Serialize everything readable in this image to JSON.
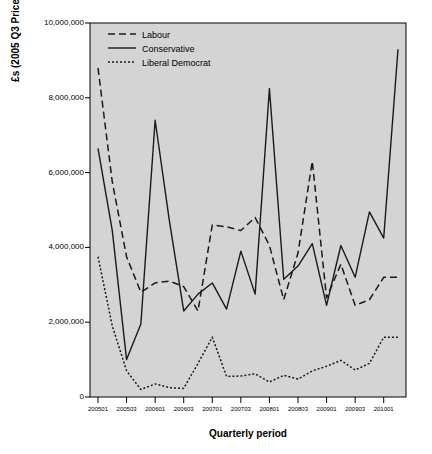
{
  "chart_data": {
    "type": "line",
    "title": "",
    "xlabel": "Quarterly period",
    "ylabel": "£s (2005 Q3 Prices)",
    "grid": false,
    "legend_position": "top-left",
    "ylim": [
      0,
      10000000
    ],
    "ytick_values": [
      0,
      2000000,
      4000000,
      6000000,
      8000000,
      10000000
    ],
    "ytick_labels": [
      "0",
      "2,000,000",
      "4,000,000",
      "6,000,000",
      "8,000,000",
      "10,000,000"
    ],
    "xtick_labels": [
      "200501",
      "200503",
      "200601",
      "200603",
      "200701",
      "200703",
      "200801",
      "200803",
      "200901",
      "200903",
      "201001"
    ],
    "x": [
      "200501",
      "200502",
      "200503",
      "200504",
      "200601",
      "200602",
      "200603",
      "200604",
      "200701",
      "200702",
      "200703",
      "200704",
      "200801",
      "200802",
      "200803",
      "200804",
      "200901",
      "200902",
      "200903",
      "200904",
      "201001"
    ],
    "series": [
      {
        "name": "Labour",
        "style": "long-dash",
        "color": "#1a1a1a",
        "values": [
          8800000,
          5750000,
          3750000,
          2800000,
          3050000,
          3100000,
          2950000,
          2300000,
          4600000,
          4550000,
          4450000,
          4800000,
          4050000,
          2600000,
          3850000,
          6300000,
          2650000,
          3550000,
          2450000,
          2600000,
          3200000
        ]
      },
      {
        "name": "Conservative",
        "style": "solid",
        "color": "#1a1a1a",
        "values": [
          6650000,
          4450000,
          1000000,
          1950000,
          7400000,
          4700000,
          2300000,
          2750000,
          3050000,
          2350000,
          3900000,
          2750000,
          8250000,
          3150000,
          3500000,
          4100000,
          2450000,
          4050000,
          3200000,
          4950000,
          4250000
        ]
      },
      {
        "name": "Liberal Democrat",
        "style": "short-dash",
        "color": "#1a1a1a",
        "values": [
          3750000,
          1900000,
          700000,
          200000,
          350000,
          250000,
          230000,
          900000,
          1600000,
          550000,
          560000,
          620000,
          400000,
          580000,
          480000,
          700000,
          820000,
          980000,
          720000,
          900000,
          1600000
        ]
      }
    ],
    "series_extra_tail": {
      "Conservative": [
        8250000,
        9300000
      ],
      "Labour": [
        3200000
      ],
      "Liberal Democrat": [
        1600000
      ]
    }
  },
  "legend": {
    "items": [
      {
        "label": "Labour",
        "style": "long-dash"
      },
      {
        "label": "Conservative",
        "style": "solid"
      },
      {
        "label": "Liberal Democrat",
        "style": "short-dash"
      }
    ]
  },
  "axes": {
    "x_title": "Quarterly period",
    "y_title": "£s (2005 Q3 Prices)"
  },
  "colors": {
    "plot_background": "#d4d4d4",
    "page_background": "#ffffff",
    "line": "#1a1a1a",
    "axis": "#000000"
  }
}
